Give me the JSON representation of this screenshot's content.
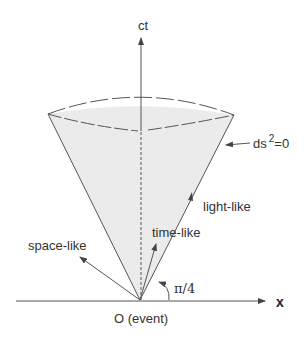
{
  "diagram": {
    "type": "light-cone",
    "axes": {
      "vertical_label": "ct",
      "horizontal_label": "x"
    },
    "origin_label": "O (event)",
    "cone_surface_label": "ds",
    "cone_surface_exponent": "2",
    "cone_surface_suffix": "=0",
    "vectors": [
      {
        "label": "space-like"
      },
      {
        "label": "time-like"
      },
      {
        "label": "light-like"
      }
    ],
    "angle_label": "π/4",
    "colors": {
      "cone_fill": "#ebebeb",
      "lines": "#555555",
      "background": "#ffffff"
    }
  }
}
